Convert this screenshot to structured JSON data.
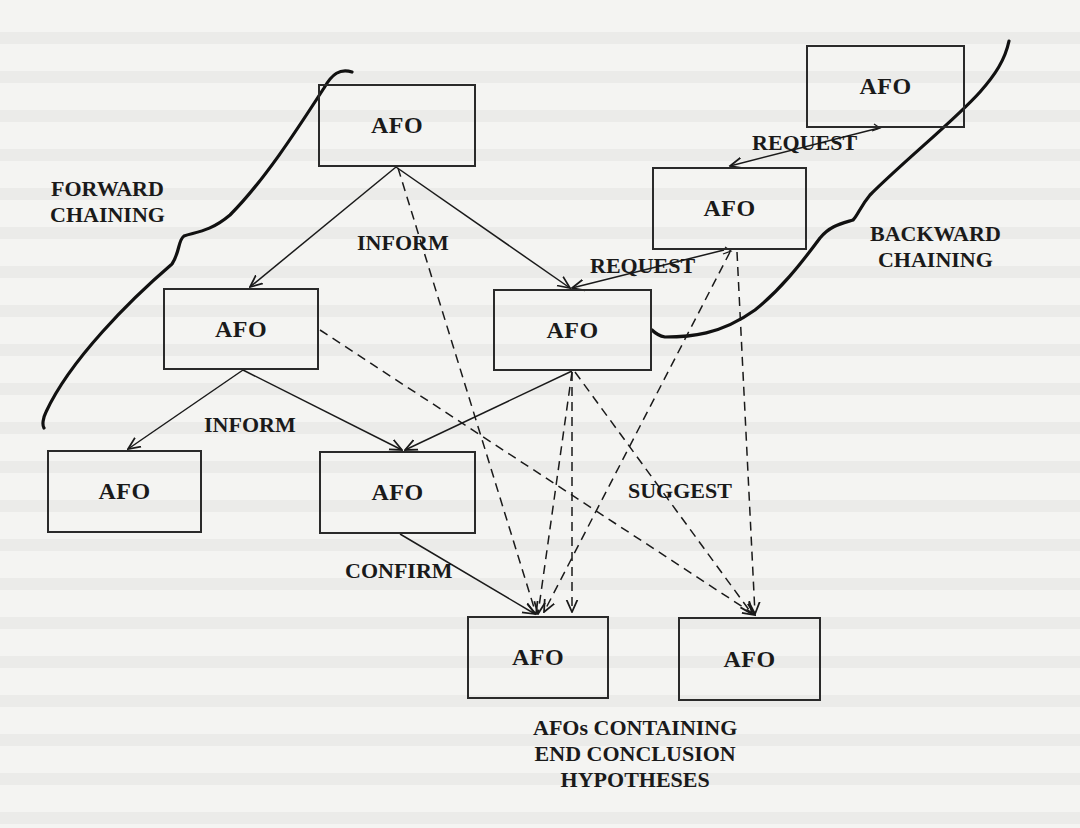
{
  "figure": {
    "node_label": "AFO",
    "nodes": [
      {
        "id": "top-center",
        "label": "AFO",
        "x": 318,
        "y": 84,
        "w": 158,
        "h": 83
      },
      {
        "id": "top-right",
        "label": "AFO",
        "x": 806,
        "y": 45,
        "w": 159,
        "h": 83
      },
      {
        "id": "mid-right",
        "label": "AFO",
        "x": 652,
        "y": 167,
        "w": 155,
        "h": 83
      },
      {
        "id": "left-mid",
        "label": "AFO",
        "x": 163,
        "y": 288,
        "w": 156,
        "h": 82
      },
      {
        "id": "center-mid",
        "label": "AFO",
        "x": 493,
        "y": 289,
        "w": 159,
        "h": 82
      },
      {
        "id": "bottom-left",
        "label": "AFO",
        "x": 47,
        "y": 450,
        "w": 155,
        "h": 83
      },
      {
        "id": "bottom-center",
        "label": "AFO",
        "x": 319,
        "y": 451,
        "w": 157,
        "h": 83
      },
      {
        "id": "conclusion-1",
        "label": "AFO",
        "x": 467,
        "y": 616,
        "w": 142,
        "h": 83
      },
      {
        "id": "conclusion-2",
        "label": "AFO",
        "x": 678,
        "y": 617,
        "w": 143,
        "h": 84
      }
    ],
    "labels": {
      "forward_chaining": [
        "FORWARD",
        "CHAINING"
      ],
      "backward_chaining": [
        "BACKWARD",
        "CHAINING"
      ],
      "inform_top": "INFORM",
      "inform_bottom": "INFORM",
      "request_top": "REQUEST",
      "request_bottom": "REQUEST",
      "suggest": "SUGGEST",
      "confirm": "CONFIRM",
      "conclusion_caption": [
        "AFOs CONTAINING",
        "END CONCLUSION",
        "HYPOTHESES"
      ]
    },
    "edges": [
      {
        "from": "top-center",
        "to": "left-mid",
        "type": "solid",
        "message": "INFORM"
      },
      {
        "from": "top-center",
        "to": "center-mid",
        "type": "solid",
        "message": "INFORM"
      },
      {
        "from": "left-mid",
        "to": "bottom-left",
        "type": "solid",
        "message": "INFORM"
      },
      {
        "from": "left-mid",
        "to": "bottom-center",
        "type": "solid",
        "message": "INFORM"
      },
      {
        "from": "center-mid",
        "to": "bottom-center",
        "type": "solid",
        "message": "INFORM"
      },
      {
        "from": "bottom-center",
        "to": "conclusion-1",
        "type": "solid",
        "message": "CONFIRM"
      },
      {
        "from": "top-right",
        "to": "mid-right",
        "type": "solid",
        "message": "REQUEST"
      },
      {
        "from": "mid-right",
        "to": "center-mid",
        "type": "solid",
        "message": "REQUEST"
      },
      {
        "from": "top-center",
        "to": "conclusion-1",
        "type": "dashed",
        "message": "SUGGEST"
      },
      {
        "from": "left-mid",
        "to": "conclusion-2",
        "type": "dashed",
        "message": "SUGGEST"
      },
      {
        "from": "center-mid",
        "to": "conclusion-1",
        "type": "dashed",
        "message": "SUGGEST"
      },
      {
        "from": "center-mid",
        "to": "conclusion-2",
        "type": "dashed",
        "message": "SUGGEST"
      },
      {
        "from": "mid-right",
        "to": "conclusion-1",
        "type": "dashed",
        "message": "SUGGEST"
      },
      {
        "from": "mid-right",
        "to": "conclusion-2",
        "type": "dashed",
        "message": "SUGGEST"
      }
    ],
    "colors": {
      "ink": "#1a1a1a",
      "paper": "#f4f4f2"
    }
  }
}
